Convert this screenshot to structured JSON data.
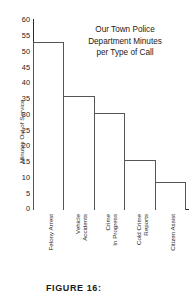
{
  "chart_data": {
    "type": "bar",
    "title_lines": [
      "Our Town Police",
      "Department Minutes",
      "per Type of Call"
    ],
    "xlabel": "",
    "ylabel": "Minutes Out of Service",
    "ylim": [
      0,
      60
    ],
    "ytick_step": 5,
    "yticks": [
      60,
      55,
      50,
      45,
      40,
      35,
      30,
      25,
      20,
      15,
      10,
      5,
      0
    ],
    "ytick_labels": [
      "60",
      "55",
      "50",
      "45",
      "40",
      "35",
      "30",
      "25",
      "20",
      "15",
      "10",
      "5",
      "0"
    ],
    "grid": false,
    "legend": "none",
    "categories": [
      "Felony Arrest",
      "Vehicle Accidents",
      "Crime In Progress",
      "Cold Crime Reports",
      "Citizen Assist"
    ],
    "category_label_lines": [
      [
        "Felony Arrest"
      ],
      [
        "Vehicle",
        "Accidents"
      ],
      [
        "Crime",
        "In Progress"
      ],
      [
        "Cold Crime",
        "Reports"
      ],
      [
        "Citizen Assist"
      ]
    ],
    "values": [
      53,
      36,
      30.5,
      15.5,
      8.5
    ],
    "bar_fill": "#ffffff",
    "bar_edge": "#555555",
    "axis_color": "#2b2b2b"
  },
  "caption": {
    "text": "FIGURE 16:"
  }
}
